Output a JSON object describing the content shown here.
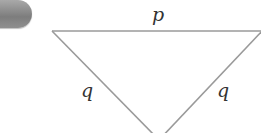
{
  "badge": {
    "number": "4",
    "color": "#8a8a8a"
  },
  "figure": {
    "type": "isosceles-triangle",
    "orientation": "inverted",
    "line_color": "#9a9a9a",
    "sides": {
      "top": "p",
      "left": "q",
      "right": "q"
    }
  }
}
